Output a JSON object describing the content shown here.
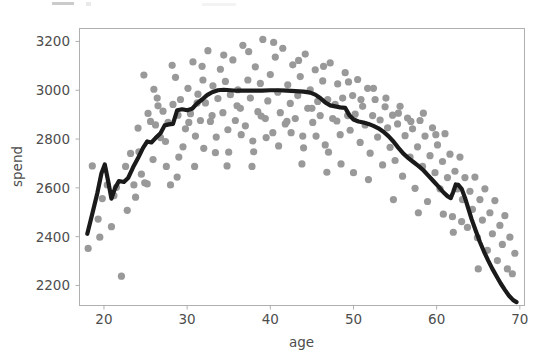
{
  "figure": {
    "width": 542,
    "height": 353,
    "background": "#ffffff",
    "clipped_header_note": "partially cut-off artifact row at very top edge"
  },
  "style": {
    "scatter_color": "#999999",
    "line_color": "#1a1a1a",
    "spine_color": "#b0b0b0",
    "text_color": "#4d4d4d",
    "scatter_radius": 3.6,
    "line_width": 4.2
  },
  "axes_geometry": {
    "left": 79,
    "right": 524,
    "top": 28,
    "bottom": 305
  },
  "chart_data": {
    "type": "scatter",
    "title": "",
    "subtitle": "",
    "xlabel": "age",
    "ylabel": "spend",
    "xlim": [
      17,
      70.5
    ],
    "ylim": [
      2120,
      3255
    ],
    "xticks": [
      20,
      30,
      40,
      50,
      60,
      70
    ],
    "yticks": [
      2200,
      2400,
      2600,
      2800,
      3000,
      3200
    ],
    "grid": false,
    "legend": null,
    "legend_position": "none",
    "series": [
      {
        "name": "observations",
        "type": "scatter",
        "color": "#999999",
        "points": [
          [
            18.1,
            2352
          ],
          [
            18.6,
            2690
          ],
          [
            19.3,
            2472
          ],
          [
            19.8,
            2556
          ],
          [
            20.4,
            2612
          ],
          [
            20.9,
            2441
          ],
          [
            21.5,
            2602
          ],
          [
            22.1,
            2238
          ],
          [
            22.6,
            2688
          ],
          [
            23.2,
            2741
          ],
          [
            23.6,
            2612
          ],
          [
            24.1,
            2845
          ],
          [
            24.5,
            2656
          ],
          [
            24.9,
            2621
          ],
          [
            25.3,
            2905
          ],
          [
            25.6,
            2872
          ],
          [
            25.9,
            2716
          ],
          [
            26.2,
            2858
          ],
          [
            26.5,
            2936
          ],
          [
            26.8,
            2806
          ],
          [
            27.1,
            2914
          ],
          [
            27.4,
            2790
          ],
          [
            27.7,
            2868
          ],
          [
            28.0,
            2612
          ],
          [
            28.3,
            2942
          ],
          [
            28.6,
            3053
          ],
          [
            28.9,
            2898
          ],
          [
            29.2,
            2962
          ],
          [
            29.5,
            2768
          ],
          [
            29.8,
            2842
          ],
          [
            30.1,
            3008
          ],
          [
            30.4,
            2904
          ],
          [
            30.7,
            3116
          ],
          [
            31.0,
            2812
          ],
          [
            31.3,
            2984
          ],
          [
            31.6,
            2876
          ],
          [
            31.9,
            3042
          ],
          [
            32.2,
            2948
          ],
          [
            32.5,
            3162
          ],
          [
            32.8,
            2872
          ],
          [
            33.1,
            3018
          ],
          [
            33.4,
            2744
          ],
          [
            33.7,
            2966
          ],
          [
            34.0,
            3086
          ],
          [
            34.3,
            2908
          ],
          [
            34.6,
            3036
          ],
          [
            34.9,
            2838
          ],
          [
            35.2,
            2982
          ],
          [
            35.5,
            3124
          ],
          [
            35.8,
            2876
          ],
          [
            36.1,
            3002
          ],
          [
            36.4,
            2926
          ],
          [
            36.7,
            3184
          ],
          [
            37.0,
            2854
          ],
          [
            37.3,
            3042
          ],
          [
            37.6,
            2968
          ],
          [
            37.9,
            2792
          ],
          [
            38.2,
            3096
          ],
          [
            38.5,
            2912
          ],
          [
            38.8,
            3028
          ],
          [
            39.1,
            3208
          ],
          [
            39.4,
            2884
          ],
          [
            39.7,
            2956
          ],
          [
            40.0,
            3064
          ],
          [
            40.3,
            2826
          ],
          [
            40.6,
            3136
          ],
          [
            40.9,
            2992
          ],
          [
            41.2,
            2908
          ],
          [
            41.5,
            3172
          ],
          [
            41.8,
            2862
          ],
          [
            42.1,
            3022
          ],
          [
            42.4,
            2946
          ],
          [
            42.7,
            3104
          ],
          [
            43.0,
            2884
          ],
          [
            43.3,
            2978
          ],
          [
            43.6,
            3056
          ],
          [
            43.9,
            2812
          ],
          [
            44.2,
            3148
          ],
          [
            44.5,
            2926
          ],
          [
            44.8,
            3002
          ],
          [
            45.1,
            2868
          ],
          [
            45.4,
            3084
          ],
          [
            45.7,
            2954
          ],
          [
            46.0,
            2896
          ],
          [
            46.3,
            3038
          ],
          [
            46.6,
            2776
          ],
          [
            46.9,
            2962
          ],
          [
            47.2,
            3112
          ],
          [
            47.5,
            2884
          ],
          [
            47.8,
            2942
          ],
          [
            48.1,
            3026
          ],
          [
            48.4,
            2818
          ],
          [
            48.7,
            2968
          ],
          [
            49.0,
            3072
          ],
          [
            49.3,
            2896
          ],
          [
            49.6,
            2836
          ],
          [
            49.9,
            2978
          ],
          [
            50.2,
            2902
          ],
          [
            50.5,
            3044
          ],
          [
            50.8,
            2786
          ],
          [
            51.1,
            2934
          ],
          [
            51.4,
            2858
          ],
          [
            51.7,
            3008
          ],
          [
            52.0,
            2742
          ],
          [
            52.3,
            2896
          ],
          [
            52.6,
            2962
          ],
          [
            52.9,
            2808
          ],
          [
            53.2,
            2878
          ],
          [
            53.5,
            2694
          ],
          [
            53.8,
            2932
          ],
          [
            54.1,
            2846
          ],
          [
            54.4,
            2766
          ],
          [
            54.7,
            2898
          ],
          [
            55.0,
            2712
          ],
          [
            55.3,
            2862
          ],
          [
            55.6,
            2934
          ],
          [
            55.9,
            2648
          ],
          [
            56.2,
            2814
          ],
          [
            56.5,
            2886
          ],
          [
            56.8,
            2726
          ],
          [
            57.1,
            2842
          ],
          [
            57.4,
            2598
          ],
          [
            57.7,
            2768
          ],
          [
            58.0,
            2876
          ],
          [
            58.3,
            2688
          ],
          [
            58.6,
            2812
          ],
          [
            58.9,
            2544
          ],
          [
            59.2,
            2732
          ],
          [
            59.5,
            2846
          ],
          [
            59.8,
            2662
          ],
          [
            60.1,
            2776
          ],
          [
            60.4,
            2596
          ],
          [
            60.7,
            2708
          ],
          [
            61.0,
            2822
          ],
          [
            61.3,
            2642
          ],
          [
            61.6,
            2738
          ],
          [
            61.9,
            2482
          ],
          [
            62.2,
            2668
          ],
          [
            62.5,
            2596
          ],
          [
            62.8,
            2726
          ],
          [
            63.1,
            2552
          ],
          [
            63.4,
            2642
          ],
          [
            63.7,
            2438
          ],
          [
            64.0,
            2586
          ],
          [
            64.3,
            2512
          ],
          [
            64.6,
            2644
          ],
          [
            64.9,
            2396
          ],
          [
            65.2,
            2552
          ],
          [
            65.5,
            2468
          ],
          [
            65.8,
            2596
          ],
          [
            66.1,
            2344
          ],
          [
            66.4,
            2498
          ],
          [
            66.7,
            2412
          ],
          [
            67.0,
            2548
          ],
          [
            67.3,
            2302
          ],
          [
            67.6,
            2446
          ],
          [
            67.9,
            2368
          ],
          [
            68.2,
            2486
          ],
          [
            68.5,
            2268
          ],
          [
            68.8,
            2398
          ],
          [
            69.1,
            2248
          ],
          [
            69.4,
            2332
          ],
          [
            26.0,
            3004
          ],
          [
            27.5,
            2688
          ],
          [
            29.0,
            2726
          ],
          [
            30.9,
            2688
          ],
          [
            32.0,
            2762
          ],
          [
            33.5,
            2808
          ],
          [
            35.0,
            2746
          ],
          [
            36.5,
            2818
          ],
          [
            38.0,
            2748
          ],
          [
            39.5,
            2806
          ],
          [
            41.0,
            2772
          ],
          [
            42.5,
            2826
          ],
          [
            44.0,
            2764
          ],
          [
            45.5,
            2812
          ],
          [
            47.0,
            2746
          ],
          [
            48.5,
            2698
          ],
          [
            50.0,
            2662
          ],
          [
            24.8,
            3062
          ],
          [
            26.4,
            2968
          ],
          [
            28.2,
            3102
          ],
          [
            30.2,
            2868
          ],
          [
            31.8,
            3098
          ],
          [
            33.0,
            2896
          ],
          [
            34.4,
            3144
          ],
          [
            36.0,
            2936
          ],
          [
            37.4,
            3158
          ],
          [
            38.9,
            2894
          ],
          [
            40.4,
            3196
          ],
          [
            42.0,
            2872
          ],
          [
            43.4,
            3122
          ],
          [
            45.0,
            2926
          ],
          [
            46.4,
            3098
          ],
          [
            48.0,
            2874
          ],
          [
            49.4,
            3034
          ],
          [
            50.9,
            2962
          ],
          [
            52.4,
            3008
          ],
          [
            53.9,
            2968
          ],
          [
            55.4,
            2906
          ],
          [
            56.9,
            2872
          ],
          [
            58.4,
            2906
          ],
          [
            59.9,
            2818
          ],
          [
            24.2,
            2748
          ],
          [
            25.2,
            2616
          ],
          [
            28.8,
            2644
          ],
          [
            31.2,
            2948
          ],
          [
            34.8,
            2690
          ],
          [
            37.8,
            2688
          ],
          [
            43.8,
            2698
          ],
          [
            46.8,
            2664
          ],
          [
            51.8,
            2634
          ],
          [
            54.8,
            2552
          ],
          [
            57.8,
            2498
          ],
          [
            60.8,
            2492
          ],
          [
            62.0,
            2418
          ],
          [
            63.0,
            2462
          ],
          [
            65.0,
            2268
          ],
          [
            22.8,
            2508
          ],
          [
            23.8,
            2562
          ],
          [
            21.2,
            2568
          ],
          [
            19.5,
            2398
          ]
        ]
      },
      {
        "name": "smoothed trend",
        "type": "line",
        "color": "#1a1a1a",
        "points": [
          [
            18.0,
            2412
          ],
          [
            18.6,
            2494
          ],
          [
            19.2,
            2578
          ],
          [
            19.7,
            2660
          ],
          [
            20.1,
            2696
          ],
          [
            20.5,
            2628
          ],
          [
            20.9,
            2556
          ],
          [
            21.3,
            2596
          ],
          [
            21.8,
            2628
          ],
          [
            22.4,
            2624
          ],
          [
            22.9,
            2640
          ],
          [
            23.5,
            2684
          ],
          [
            24.1,
            2722
          ],
          [
            24.7,
            2764
          ],
          [
            25.2,
            2790
          ],
          [
            25.7,
            2786
          ],
          [
            26.2,
            2804
          ],
          [
            26.8,
            2824
          ],
          [
            27.3,
            2856
          ],
          [
            27.8,
            2860
          ],
          [
            28.3,
            2862
          ],
          [
            28.8,
            2918
          ],
          [
            29.4,
            2922
          ],
          [
            30.0,
            2918
          ],
          [
            30.6,
            2924
          ],
          [
            31.2,
            2946
          ],
          [
            31.8,
            2962
          ],
          [
            32.4,
            2980
          ],
          [
            33.0,
            2992
          ],
          [
            33.7,
            3000
          ],
          [
            34.4,
            3002
          ],
          [
            35.2,
            3000
          ],
          [
            36.0,
            2998
          ],
          [
            37.0,
            2998
          ],
          [
            38.0,
            2998
          ],
          [
            39.0,
            2998
          ],
          [
            40.0,
            3000
          ],
          [
            41.0,
            3000
          ],
          [
            42.0,
            2998
          ],
          [
            43.0,
            2996
          ],
          [
            44.0,
            2994
          ],
          [
            44.8,
            2990
          ],
          [
            45.4,
            2982
          ],
          [
            46.0,
            2968
          ],
          [
            46.6,
            2950
          ],
          [
            47.2,
            2938
          ],
          [
            47.8,
            2934
          ],
          [
            48.4,
            2930
          ],
          [
            49.0,
            2928
          ],
          [
            49.5,
            2898
          ],
          [
            50.0,
            2880
          ],
          [
            50.6,
            2872
          ],
          [
            51.2,
            2868
          ],
          [
            51.8,
            2862
          ],
          [
            52.4,
            2854
          ],
          [
            53.0,
            2844
          ],
          [
            53.6,
            2830
          ],
          [
            54.2,
            2812
          ],
          [
            54.8,
            2790
          ],
          [
            55.4,
            2764
          ],
          [
            56.0,
            2740
          ],
          [
            56.6,
            2722
          ],
          [
            57.2,
            2706
          ],
          [
            57.8,
            2690
          ],
          [
            58.4,
            2672
          ],
          [
            59.0,
            2650
          ],
          [
            59.6,
            2628
          ],
          [
            60.2,
            2606
          ],
          [
            60.8,
            2582
          ],
          [
            61.3,
            2566
          ],
          [
            61.7,
            2558
          ],
          [
            62.0,
            2584
          ],
          [
            62.3,
            2614
          ],
          [
            62.6,
            2612
          ],
          [
            63.0,
            2596
          ],
          [
            63.4,
            2560
          ],
          [
            63.8,
            2516
          ],
          [
            64.2,
            2472
          ],
          [
            64.7,
            2424
          ],
          [
            65.2,
            2378
          ],
          [
            65.7,
            2338
          ],
          [
            66.2,
            2302
          ],
          [
            66.7,
            2268
          ],
          [
            67.2,
            2238
          ],
          [
            67.7,
            2208
          ],
          [
            68.2,
            2182
          ],
          [
            68.7,
            2158
          ],
          [
            69.2,
            2140
          ],
          [
            69.6,
            2132
          ]
        ]
      }
    ]
  }
}
